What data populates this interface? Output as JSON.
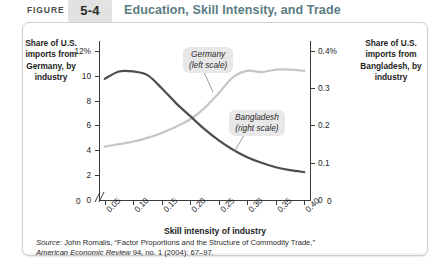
{
  "header": {
    "figure_word": "FIGURE",
    "figure_number": "5-4",
    "title": "Education, Skill Intensity, and Trade",
    "title_color": "#5a7b82",
    "number_box_color": "#e2e2e2"
  },
  "axis_titles": {
    "left": "Share of U.S. imports from Germany, by industry",
    "right": "Share of U.S. imports from Bangladesh, by industry",
    "x": "Skill intensity of industry"
  },
  "callouts": {
    "germany": "Germany (left scale)",
    "germany_line1": "Germany",
    "germany_line2": "(left scale)",
    "bangladesh_line1": "Bangladesh",
    "bangladesh_line2": "(right scale)"
  },
  "source": {
    "label": "Source:",
    "line1": " John Romalis, “Factor Proportions and the Structure of Commodity Trade,”",
    "journal": "American Economic Review",
    "line2": " 94, no. 1 (2004): 67–97."
  },
  "chart_data": {
    "type": "line",
    "title": "Education, Skill Intensity, and Trade",
    "xlabel": "Skill intensity of industry",
    "grid": false,
    "legend_position": "inline-callouts",
    "x": [
      0.05,
      0.075,
      0.1,
      0.125,
      0.15,
      0.175,
      0.2,
      0.225,
      0.25,
      0.275,
      0.3,
      0.325,
      0.35,
      0.375,
      0.4
    ],
    "xlim": [
      0.04,
      0.41
    ],
    "xticks": [
      "0.05",
      "0.10",
      "0.15",
      "0.20",
      "0.25",
      "0.30",
      "0.35",
      "0.40"
    ],
    "x_origin_label": "0",
    "axis_break": true,
    "left_axis": {
      "label": "Share of U.S. imports from Germany, by industry",
      "ticks": [
        "0",
        "2",
        "4",
        "6",
        "8",
        "10",
        "12%"
      ],
      "tick_values": [
        0,
        2,
        4,
        6,
        8,
        10,
        12
      ],
      "ylim": [
        0,
        12.8
      ]
    },
    "right_axis": {
      "label": "Share of U.S. imports from Bangladesh, by industry",
      "ticks": [
        "0",
        "0.1",
        "0.2",
        "0.3",
        "0.4%"
      ],
      "tick_values": [
        0,
        0.1,
        0.2,
        0.3,
        0.4
      ],
      "ylim": [
        0,
        0.4267
      ]
    },
    "series": [
      {
        "name": "Germany",
        "scale": "left",
        "color": "#c6c6c6",
        "units": "percent of U.S. imports",
        "values": [
          4.3,
          4.5,
          4.7,
          5.0,
          5.4,
          5.9,
          6.5,
          7.4,
          8.6,
          9.9,
          10.4,
          10.3,
          10.5,
          10.5,
          10.4
        ]
      },
      {
        "name": "Bangladesh",
        "scale": "right",
        "color": "#4d4d4d",
        "units": "percent of U.S. imports",
        "values": [
          0.325,
          0.345,
          0.345,
          0.335,
          0.3,
          0.26,
          0.225,
          0.19,
          0.16,
          0.135,
          0.115,
          0.1,
          0.088,
          0.08,
          0.075
        ]
      }
    ]
  }
}
